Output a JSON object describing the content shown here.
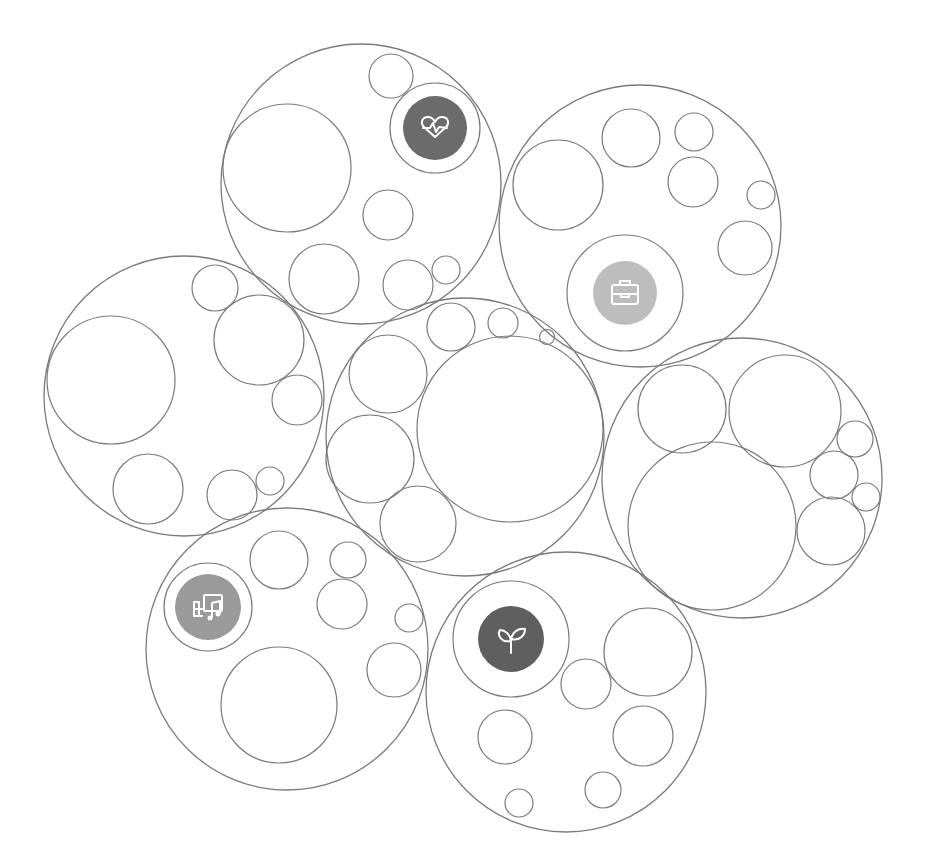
{
  "diagram": {
    "type": "circle-packing",
    "groups": [
      {
        "id": "health",
        "icon": "heart-pulse-icon",
        "icon_color": "#6b6b6b",
        "children": 7
      },
      {
        "id": "work",
        "icon": "briefcase-icon",
        "icon_color": "#bdbdbd",
        "children": 7
      },
      {
        "id": "misc-left",
        "icon": null,
        "children": 7
      },
      {
        "id": "center",
        "icon": null,
        "children": 7
      },
      {
        "id": "misc-right",
        "icon": null,
        "children": 7
      },
      {
        "id": "entertainment",
        "icon": "media-music-icon",
        "icon_color": "#9a9a9a",
        "children": 7
      },
      {
        "id": "growth",
        "icon": "sprout-icon",
        "icon_color": "#5f5f5f",
        "children": 7
      }
    ],
    "stroke_color": "#7a7a7a",
    "background": "#ffffff"
  }
}
